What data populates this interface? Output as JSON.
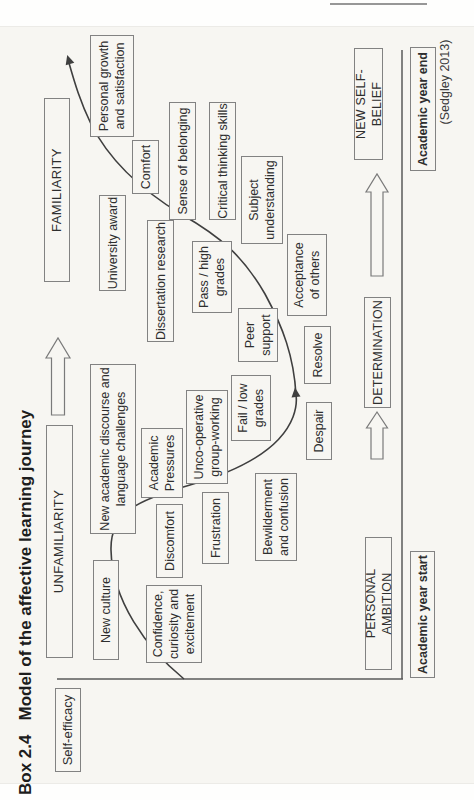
{
  "page": {
    "box_label": "Box 2.4",
    "title": "Model of the affective learning journey",
    "credit": "(Sedgley 2013)"
  },
  "chart": {
    "y_axis_label": "Self-efficacy",
    "top_scale": [
      {
        "label": "UNFAMILIARITY",
        "x": 142,
        "y": 46,
        "w": 233,
        "h": 27
      },
      {
        "label": "FAMILIARITY",
        "x": 518,
        "y": 44,
        "w": 184,
        "h": 26
      }
    ],
    "milestones": [
      {
        "label": "PERSONAL AMBITION",
        "x": 130,
        "y": 365,
        "w": 133,
        "h": 27
      },
      {
        "label": "DETERMINATION",
        "x": 392,
        "y": 364,
        "w": 111,
        "h": 27
      },
      {
        "label": "NEW SELF-BELIEF",
        "x": 640,
        "y": 354,
        "w": 112,
        "h": 29
      }
    ],
    "x_axis_labels": [
      {
        "label": "Academic year start",
        "x": 122,
        "y": 410,
        "w": 127,
        "h": 25
      },
      {
        "label": "Academic year end",
        "x": 629,
        "y": 410,
        "w": 124,
        "h": 26
      }
    ],
    "nodes": [
      {
        "label": "New culture",
        "x": 140,
        "y": 93,
        "w": 100,
        "h": 26
      },
      {
        "label": "Confidence,\ncuriosity and\nexcitement",
        "x": 137,
        "y": 146,
        "w": 78,
        "h": 56
      },
      {
        "label": "New academic discourse and\nlanguage challenges",
        "x": 266,
        "y": 90,
        "w": 170,
        "h": 46
      },
      {
        "label": "Academic\nPressures",
        "x": 302,
        "y": 141,
        "w": 70,
        "h": 42
      },
      {
        "label": "Discomfort",
        "x": 222,
        "y": 156,
        "w": 74,
        "h": 27
      },
      {
        "label": "Frustration",
        "x": 236,
        "y": 202,
        "w": 72,
        "h": 27
      },
      {
        "label": "Unco-operative\ngroup-working",
        "x": 316,
        "y": 186,
        "w": 94,
        "h": 42
      },
      {
        "label": "Bewilderment\nand confusion",
        "x": 239,
        "y": 255,
        "w": 88,
        "h": 42
      },
      {
        "label": "Fail / low\ngrades",
        "x": 359,
        "y": 231,
        "w": 66,
        "h": 40
      },
      {
        "label": "Despair",
        "x": 340,
        "y": 306,
        "w": 58,
        "h": 26
      },
      {
        "label": "Peer\nsupport",
        "x": 438,
        "y": 238,
        "w": 54,
        "h": 40
      },
      {
        "label": "Resolve",
        "x": 416,
        "y": 304,
        "w": 58,
        "h": 27
      },
      {
        "label": "Pass / high\ngrades",
        "x": 487,
        "y": 192,
        "w": 72,
        "h": 40
      },
      {
        "label": "Acceptance\nof others",
        "x": 484,
        "y": 287,
        "w": 82,
        "h": 40
      },
      {
        "label": "Dissertation research",
        "x": 458,
        "y": 147,
        "w": 122,
        "h": 27
      },
      {
        "label": "University award",
        "x": 509,
        "y": 99,
        "w": 96,
        "h": 27
      },
      {
        "label": "Comfort",
        "x": 606,
        "y": 132,
        "w": 54,
        "h": 27
      },
      {
        "label": "Sense of belonging",
        "x": 580,
        "y": 169,
        "w": 118,
        "h": 27
      },
      {
        "label": "Critical thinking skills",
        "x": 580,
        "y": 209,
        "w": 118,
        "h": 27
      },
      {
        "label": "Subject\nunderstanding",
        "x": 556,
        "y": 241,
        "w": 88,
        "h": 42
      },
      {
        "label": "Personal growth\nand satisfaction",
        "x": 663,
        "y": 90,
        "w": 102,
        "h": 44
      }
    ]
  }
}
